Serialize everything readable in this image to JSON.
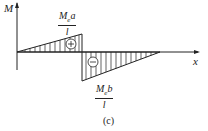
{
  "diagram": {
    "type": "bending-moment-diagram",
    "axes": {
      "y_label": "M",
      "x_label": "x"
    },
    "positive_region": {
      "sign": "+",
      "label": {
        "num_main": "M",
        "num_sub": "e",
        "num_tail": "a",
        "den": "l"
      }
    },
    "negative_region": {
      "sign": "−",
      "label": {
        "num_main": "M",
        "num_sub": "e",
        "num_tail": "b",
        "den": "l"
      }
    },
    "caption": "(c)",
    "colors": {
      "line": "#222222",
      "background": "#ffffff"
    }
  }
}
